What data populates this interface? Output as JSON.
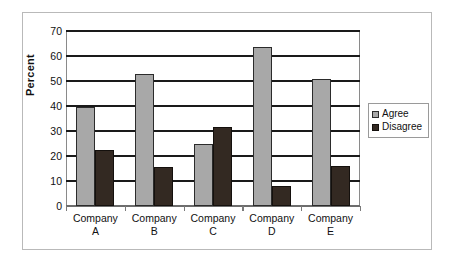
{
  "chart_data": {
    "type": "bar",
    "title": "",
    "subtitle": "",
    "xlabel": "",
    "ylabel": "Percent",
    "ylim": [
      0,
      70
    ],
    "yticks": [
      "0",
      "10",
      "20",
      "30",
      "40",
      "50",
      "60",
      "70"
    ],
    "grid": true,
    "legend_position": "right",
    "categories": [
      "Company\nA",
      "Company\nB",
      "Company\nC",
      "Company\nD",
      "Company\nE"
    ],
    "category_lines": [
      {
        "line1": "Company",
        "line2": "A"
      },
      {
        "line1": "Company",
        "line2": "B"
      },
      {
        "line1": "Company",
        "line2": "C"
      },
      {
        "line1": "Company",
        "line2": "D"
      },
      {
        "line1": "Company",
        "line2": "E"
      }
    ],
    "series": [
      {
        "name": "Agree",
        "color": "#a8a8a8",
        "values": [
          39.5,
          53,
          25,
          63.5,
          51
        ]
      },
      {
        "name": "Disagree",
        "color": "#332922",
        "values": [
          22.5,
          15.5,
          31.5,
          8,
          16
        ]
      }
    ]
  },
  "legend": {
    "entries": [
      {
        "label": "Agree",
        "swatch": "agree"
      },
      {
        "label": "Disagree",
        "swatch": "disagree"
      }
    ]
  },
  "colors": {
    "agree": "#a8a8a8",
    "disagree": "#332922",
    "gridline": "#1a1a1a",
    "frame": "#b9b9b9",
    "axis": "#8a8a8a"
  }
}
